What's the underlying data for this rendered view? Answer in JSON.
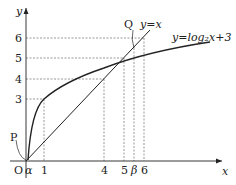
{
  "diagram": {
    "axes": {
      "x_label": "x",
      "y_label": "y",
      "origin_label": "O"
    },
    "x_ticks": [
      {
        "label": "α",
        "value": 0.15
      },
      {
        "label": "1",
        "value": 1
      },
      {
        "label": "4",
        "value": 4
      },
      {
        "label": "5",
        "value": 5
      },
      {
        "label": "β",
        "value": 5.5
      },
      {
        "label": "6",
        "value": 6
      }
    ],
    "y_ticks": [
      {
        "label": "3",
        "value": 3
      },
      {
        "label": "4",
        "value": 4
      },
      {
        "label": "5",
        "value": 5
      },
      {
        "label": "6",
        "value": 6
      }
    ],
    "curves": [
      {
        "label": "y=log₂x+3",
        "name": "log-curve"
      },
      {
        "label": "y=x",
        "name": "line-y-equals-x"
      }
    ],
    "points": [
      {
        "label": "P",
        "desc": "intersection near origin (α, α)"
      },
      {
        "label": "Q",
        "desc": "intersection (β, β)"
      }
    ]
  }
}
